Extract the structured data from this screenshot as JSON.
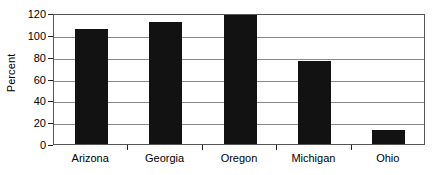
{
  "chart_data": {
    "type": "bar",
    "title": "",
    "subtitle": "",
    "xlabel": "",
    "ylabel": "Percent",
    "categories": [
      "Arizona",
      "Georgia",
      "Oregon",
      "Michigan",
      "Ohio"
    ],
    "values": [
      105,
      112,
      118,
      76,
      13
    ],
    "series": [
      {
        "name": "Percent",
        "values": [
          105,
          112,
          118,
          76,
          13
        ]
      }
    ],
    "ylim": [
      0,
      120
    ],
    "yticks": [
      0,
      20,
      40,
      60,
      80,
      100,
      120
    ],
    "ytick_labels": [
      "0",
      "20",
      "40",
      "60",
      "80",
      "100",
      "120"
    ],
    "grid": "horizontal",
    "legend": "none",
    "bar_color": "#121212",
    "gridline_color": "#8a8a8a",
    "axis_color": "#555555",
    "background_color": "#ffffff",
    "annotations": []
  }
}
